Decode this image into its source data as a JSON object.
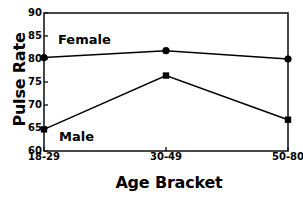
{
  "chart_data": {
    "type": "line",
    "title": "",
    "xlabel": "Age Bracket",
    "ylabel": "Pulse Rate",
    "categories": [
      "18-29",
      "30-49",
      "50-80"
    ],
    "ylim": [
      60,
      90
    ],
    "yticks": [
      60,
      65,
      70,
      75,
      80,
      85,
      90
    ],
    "grid": false,
    "legend_position": "inline-annotations",
    "series": [
      {
        "name": "Female",
        "marker": "circle",
        "color": "#000000",
        "values": [
          80.3,
          81.8,
          80.0
        ]
      },
      {
        "name": "Male",
        "marker": "square",
        "color": "#000000",
        "values": [
          64.7,
          76.4,
          66.8
        ]
      }
    ],
    "annotations": [
      {
        "text": "Female",
        "series": "Female"
      },
      {
        "text": "Male",
        "series": "Male"
      }
    ]
  }
}
